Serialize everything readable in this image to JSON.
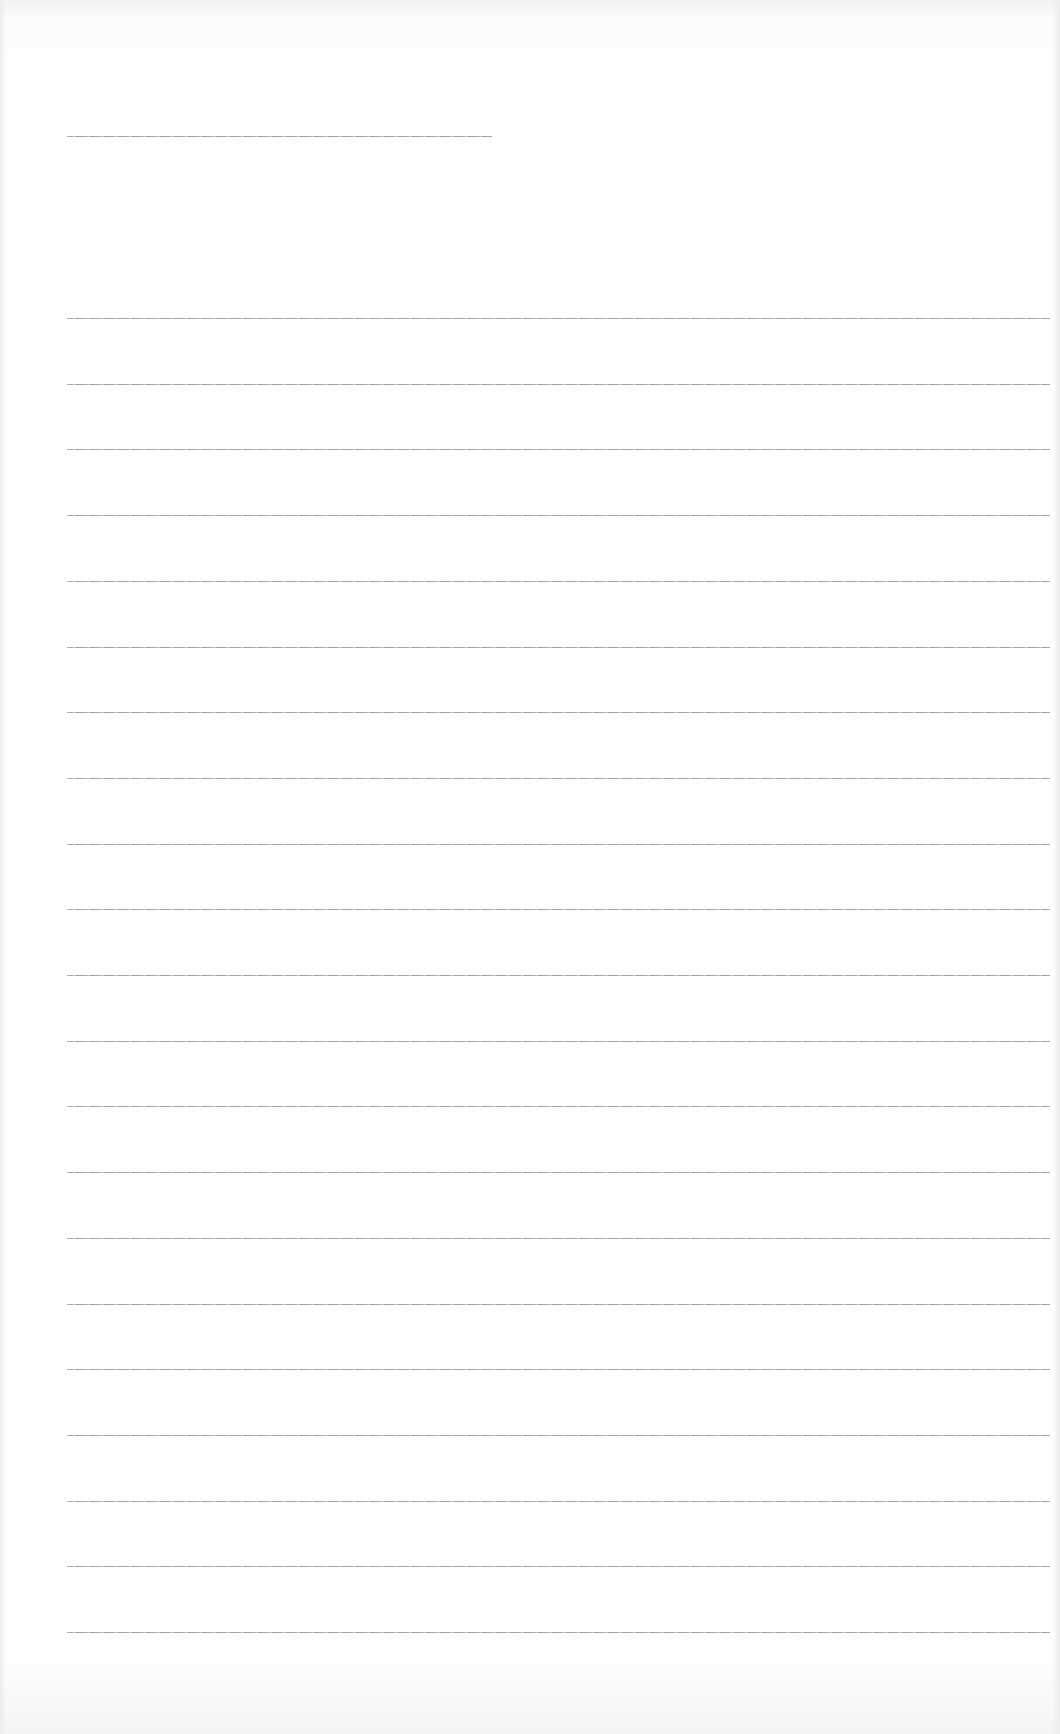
{
  "document": {
    "type": "blank ruled sheet",
    "background_color": "#fdfdfd",
    "line_color": "#9a9a9a",
    "title_line": {
      "x": 67,
      "y": 136,
      "width": 425
    },
    "ruled_lines": {
      "count": 21,
      "x": 67,
      "width": 983,
      "first_y": 318,
      "spacing": 65.7
    }
  }
}
